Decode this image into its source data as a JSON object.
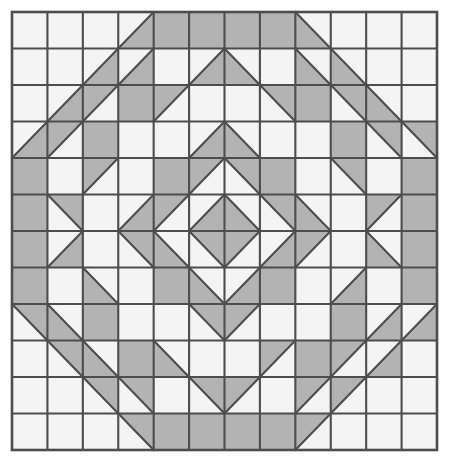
{
  "figure": {
    "name": "quilt-block-pattern",
    "type": "geometric-tiling",
    "grid_columns": 12,
    "grid_rows": 12,
    "canvas": {
      "width": 453,
      "height": 466
    },
    "grid_bounds": {
      "x": 12,
      "y": 12,
      "width": 425,
      "height": 438
    },
    "colors": {
      "background": "#ffffff",
      "cell_empty": "#f4f4f4",
      "cell_shaded": "#b3b3b3",
      "grid_line": "#4d4d4d",
      "diagonal_line": "#4d4d4d",
      "outer_border": "#4d4d4d"
    },
    "line_widths": {
      "grid": 2.1,
      "diagonal": 2.1,
      "border": 2.6
    },
    "symmetry": [
      "horizontal-mirror",
      "vertical-mirror",
      "4-fold-diagonal"
    ],
    "cell_codes": {
      "0": "empty",
      "1": "full-shaded",
      "ul": "diagonal-bl-tr-upper-left-shaded",
      "lr": "diagonal-bl-tr-lower-right-shaded",
      "ur": "diagonal-tl-br-upper-right-shaded",
      "ll": "diagonal-tl-br-lower-left-shaded"
    },
    "cells": [
      [
        "0",
        "0",
        "0",
        "lr",
        "1",
        "1",
        "1",
        "1",
        "ll",
        "0",
        "0",
        "0"
      ],
      [
        "0",
        "0",
        "lr",
        "lr",
        "0",
        "lr",
        "ll",
        "0",
        "ll",
        "ll",
        "0",
        "0"
      ],
      [
        "0",
        "lr",
        "ul",
        "1",
        "ul",
        "0",
        "0",
        "ur",
        "1",
        "ur",
        "ll",
        "0"
      ],
      [
        "lr",
        "ul",
        "1",
        "0",
        "0",
        "lr",
        "ll",
        "0",
        "0",
        "1",
        "ur",
        "ur"
      ],
      [
        "1",
        "0",
        "ul",
        "0",
        "1",
        "ul",
        "ur",
        "1",
        "0",
        "ur",
        "0",
        "1"
      ],
      [
        "1",
        "ur",
        "0",
        "lr",
        "ul",
        "lr",
        "ll",
        "ur",
        "ll",
        "0",
        "ul",
        "1"
      ],
      [
        "1",
        "lr",
        "0",
        "ur",
        "ll",
        "ur",
        "ul",
        "lr",
        "ul",
        "0",
        "ll",
        "1"
      ],
      [
        "1",
        "0",
        "ll",
        "0",
        "1",
        "ll",
        "lr",
        "1",
        "0",
        "lr",
        "0",
        "1"
      ],
      [
        "ur",
        "ll",
        "1",
        "0",
        "0",
        "ur",
        "ul",
        "0",
        "0",
        "1",
        "lr",
        "lr"
      ],
      [
        "0",
        "ur",
        "ll",
        "1",
        "ll",
        "0",
        "0",
        "ul",
        "1",
        "ul",
        "lr",
        "0"
      ],
      [
        "0",
        "0",
        "ur",
        "ur",
        "0",
        "ur",
        "ul",
        "0",
        "ul",
        "ul",
        "0",
        "0"
      ],
      [
        "0",
        "0",
        "0",
        "ur",
        "1",
        "1",
        "1",
        "1",
        "ul",
        "0",
        "0",
        "0"
      ]
    ]
  }
}
